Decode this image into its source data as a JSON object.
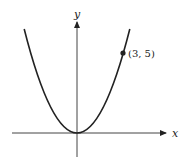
{
  "diagram": {
    "type": "function-graph",
    "equation": "y = (5/9) x^2",
    "axes": {
      "x_label": "x",
      "y_label": "y"
    },
    "curve": {
      "kind": "parabola",
      "vertex": [
        0,
        0
      ],
      "opens": "up"
    },
    "points": [
      {
        "x": 3,
        "y": 5,
        "label": "(3, 5)"
      }
    ],
    "colors": {
      "stroke": "#222222",
      "axis": "#444444",
      "background": "#ffffff"
    }
  }
}
